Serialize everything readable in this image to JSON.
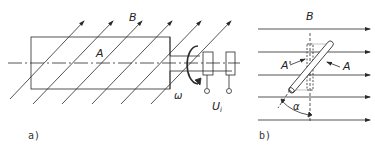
{
  "figure": {
    "panel_a": {
      "caption": "a)",
      "labels": {
        "field": "B",
        "area": "A",
        "angular_velocity": "ω",
        "voltage": "U",
        "voltage_sub": "i"
      }
    },
    "panel_b": {
      "caption": "b)",
      "labels": {
        "field": "B",
        "area": "A",
        "projected_area": "A'",
        "angle": "α"
      }
    },
    "colors": {
      "line": "#2a2a2a",
      "background": "#ffffff"
    }
  }
}
